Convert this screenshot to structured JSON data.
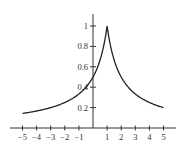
{
  "chart_data": {
    "type": "line",
    "title": "",
    "function": "y = 1/(1+|x-1|)",
    "xlabel": "",
    "ylabel": "",
    "xlim": [
      -5.5,
      5.8
    ],
    "ylim": [
      0,
      1.12
    ],
    "grid": false,
    "legend": null,
    "x_ticks": [
      -5,
      -4,
      -3,
      -2,
      -1,
      1,
      2,
      3,
      4,
      5
    ],
    "x_tick_labels": [
      "−5",
      "−4",
      "−3",
      "−2",
      "−1",
      "1",
      "2",
      "3",
      "4",
      "5"
    ],
    "y_ticks": [
      0.2,
      0.4,
      0.6,
      0.8,
      1
    ],
    "y_tick_labels": [
      "0.2",
      "0.4",
      "0.6",
      "0.8",
      "1"
    ],
    "series": [
      {
        "name": "f(x)",
        "x": [
          -5,
          -4,
          -3,
          -2,
          -1,
          0,
          0.5,
          1,
          1.5,
          2,
          3,
          4,
          5
        ],
        "y": [
          0.143,
          0.167,
          0.2,
          0.25,
          0.333,
          0.5,
          0.667,
          1.0,
          0.667,
          0.5,
          0.333,
          0.25,
          0.2
        ]
      }
    ],
    "color": "#222222"
  }
}
